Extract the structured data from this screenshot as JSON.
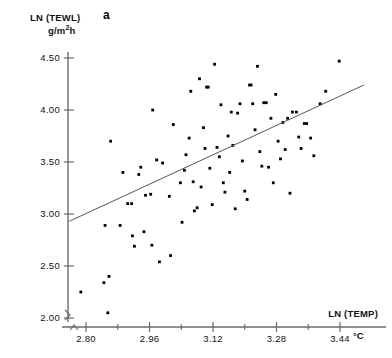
{
  "panel": {
    "letter": "a"
  },
  "axes": {
    "y_title_line1": "LN (TEWL)",
    "y_title_line2_prefix": "g/m",
    "y_title_line2_exponent": "2",
    "y_title_line2_suffix": "h",
    "x_title": "LN (TEMP)",
    "x_unit": "°C",
    "y_ticks": [
      "2.00",
      "2.50",
      "3.00",
      "3.50",
      "4.00",
      "4.50"
    ],
    "x_ticks": [
      "2.80",
      "2.96",
      "3.12",
      "3.28",
      "3.44"
    ]
  },
  "colors": {
    "axis": "#6a6a6a",
    "point": "#000000",
    "line": "#555555",
    "text": "#111111",
    "background": "#ffffff"
  },
  "chart_data": {
    "type": "scatter",
    "title": "",
    "subtitle": "",
    "panel_label": "a",
    "xlabel": "LN (TEMP)",
    "xunit": "°C",
    "ylabel": "LN (TEWL)",
    "yunit": "g/m²h",
    "xlim": [
      2.74,
      3.5
    ],
    "ylim": [
      1.92,
      4.6
    ],
    "x_ticks": [
      2.8,
      2.96,
      3.12,
      3.28,
      3.44
    ],
    "x_minor_ticks": [
      2.88,
      3.04,
      3.2,
      3.36
    ],
    "y_ticks": [
      2.0,
      2.5,
      3.0,
      3.5,
      4.0,
      4.5
    ],
    "grid": false,
    "legend": false,
    "axis_break_x": true,
    "axis_break_y": true,
    "series": [
      {
        "name": "observations",
        "marker": "filled-square",
        "points": [
          [
            2.787,
            2.25
          ],
          [
            2.845,
            2.34
          ],
          [
            2.858,
            2.4
          ],
          [
            2.855,
            2.05
          ],
          [
            2.848,
            2.89
          ],
          [
            2.862,
            3.7
          ],
          [
            2.886,
            2.89
          ],
          [
            2.893,
            3.4
          ],
          [
            2.905,
            3.1
          ],
          [
            2.915,
            3.1
          ],
          [
            2.917,
            2.79
          ],
          [
            2.922,
            2.69
          ],
          [
            2.933,
            3.38
          ],
          [
            2.938,
            3.45
          ],
          [
            2.946,
            2.83
          ],
          [
            2.95,
            3.18
          ],
          [
            2.963,
            3.19
          ],
          [
            2.968,
            4.0
          ],
          [
            2.966,
            2.7
          ],
          [
            2.978,
            3.52
          ],
          [
            2.985,
            2.54
          ],
          [
            2.993,
            3.49
          ],
          [
            3.01,
            3.17
          ],
          [
            3.013,
            2.6
          ],
          [
            3.02,
            3.86
          ],
          [
            3.038,
            3.3
          ],
          [
            3.042,
            2.92
          ],
          [
            3.048,
            3.42
          ],
          [
            3.052,
            3.57
          ],
          [
            3.06,
            3.73
          ],
          [
            3.064,
            4.18
          ],
          [
            3.07,
            3.31
          ],
          [
            3.073,
            3.03
          ],
          [
            3.08,
            3.06
          ],
          [
            3.086,
            4.3
          ],
          [
            3.09,
            3.26
          ],
          [
            3.096,
            3.83
          ],
          [
            3.1,
            3.63
          ],
          [
            3.104,
            4.22
          ],
          [
            3.108,
            4.22
          ],
          [
            3.112,
            3.44
          ],
          [
            3.118,
            3.09
          ],
          [
            3.124,
            4.44
          ],
          [
            3.13,
            3.64
          ],
          [
            3.136,
            3.55
          ],
          [
            3.14,
            4.05
          ],
          [
            3.146,
            3.3
          ],
          [
            3.15,
            3.21
          ],
          [
            3.158,
            3.75
          ],
          [
            3.162,
            3.4
          ],
          [
            3.166,
            3.98
          ],
          [
            3.17,
            3.66
          ],
          [
            3.176,
            3.05
          ],
          [
            3.182,
            3.97
          ],
          [
            3.188,
            4.06
          ],
          [
            3.194,
            3.51
          ],
          [
            3.2,
            3.22
          ],
          [
            3.206,
            3.14
          ],
          [
            3.212,
            4.24
          ],
          [
            3.216,
            4.24
          ],
          [
            3.22,
            4.06
          ],
          [
            3.226,
            3.81
          ],
          [
            3.232,
            4.42
          ],
          [
            3.238,
            3.6
          ],
          [
            3.243,
            3.46
          ],
          [
            3.248,
            4.07
          ],
          [
            3.254,
            4.07
          ],
          [
            3.26,
            3.45
          ],
          [
            3.266,
            3.92
          ],
          [
            3.272,
            3.3
          ],
          [
            3.278,
            4.15
          ],
          [
            3.284,
            3.7
          ],
          [
            3.29,
            3.53
          ],
          [
            3.296,
            3.88
          ],
          [
            3.302,
            3.62
          ],
          [
            3.308,
            3.92
          ],
          [
            3.314,
            3.2
          ],
          [
            3.32,
            3.98
          ],
          [
            3.33,
            3.98
          ],
          [
            3.336,
            3.74
          ],
          [
            3.342,
            3.63
          ],
          [
            3.35,
            3.87
          ],
          [
            3.356,
            3.87
          ],
          [
            3.366,
            3.73
          ],
          [
            3.374,
            3.56
          ],
          [
            3.39,
            4.06
          ],
          [
            3.404,
            4.18
          ],
          [
            3.438,
            4.47
          ]
        ]
      }
    ],
    "fit_line": {
      "name": "regression-line",
      "x_start": 2.758,
      "y_start": 2.93,
      "x_end": 3.5,
      "y_end": 4.24
    }
  }
}
